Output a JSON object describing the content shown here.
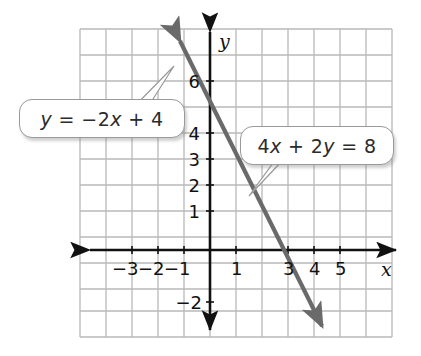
{
  "figure": {
    "type": "coordinate-grid-graph",
    "background": "#ffffff",
    "grid_color": "#b9b9b9",
    "axis_color": "#111111",
    "line_color": "#6a6a6a",
    "callout_border": "#9a9a9a"
  },
  "axes": {
    "x_label": "x",
    "y_label": "y",
    "x_ticks_labeled": [
      "-3",
      "-2",
      "-1",
      "1",
      "3",
      "4",
      "5"
    ],
    "y_ticks_labeled": [
      "6",
      "4",
      "3",
      "2",
      "1",
      "-2"
    ],
    "x_range": [
      -4,
      6
    ],
    "y_range": [
      -3,
      7
    ],
    "grid_spacing": 1,
    "arrows": [
      "left",
      "right",
      "up",
      "down"
    ]
  },
  "callouts": [
    {
      "id": "callout-1",
      "text": "y = −2x + 4",
      "parts": {
        "lhs": "y",
        "rel": " = ",
        "rhs_sign": "−",
        "rhs_coef": "2",
        "rhs_var": "x",
        "rhs_op": " + ",
        "rhs_const": "4"
      },
      "points_to": {
        "x": 2.5,
        "y": 6.5
      }
    },
    {
      "id": "callout-2",
      "text": "4x + 2y = 8",
      "parts": {
        "a": "4",
        "a_var": "x",
        "op": " + ",
        "b": "2",
        "b_var": "y",
        "rel": " = ",
        "c": "8"
      },
      "points_to": {
        "x": 1.2,
        "y": 2.0
      }
    }
  ],
  "chart_data": {
    "type": "line",
    "title": "",
    "xlabel": "x",
    "ylabel": "y",
    "xlim": [
      -4,
      6
    ],
    "ylim": [
      -3,
      7
    ],
    "grid": true,
    "legend": "none",
    "series": [
      {
        "name": "y = −2x + 4",
        "equation_slope_intercept": "y = -2x + 4",
        "equation_standard": "4x + 2y = 8",
        "slope": -2,
        "y_intercept": 4,
        "x_intercept": 2,
        "x": [
          -1.15,
          4.25
        ],
        "y": [
          6.3,
          -4.5
        ],
        "points": [
          [
            -1,
            6
          ],
          [
            0,
            4
          ],
          [
            1,
            2
          ],
          [
            2,
            0
          ],
          [
            3,
            -2
          ]
        ],
        "color": "#6a6a6a",
        "arrows_both_ends": true
      }
    ],
    "annotations": [
      {
        "text": "y = −2x + 4",
        "target_x": 2.5,
        "target_y": 6.5
      },
      {
        "text": "4x + 2y = 8",
        "target_x": 1.2,
        "target_y": 2.0
      }
    ]
  }
}
